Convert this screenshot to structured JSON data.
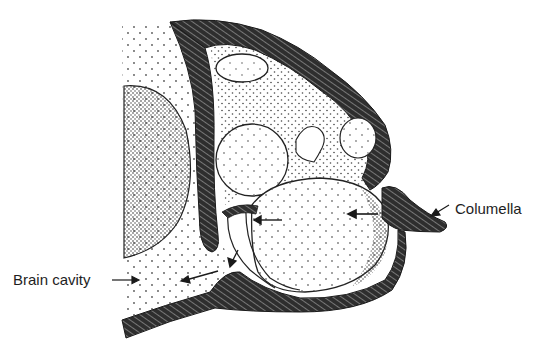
{
  "figure": {
    "type": "anatomical cross-section illustration",
    "colors": {
      "background": "#ffffff",
      "ink": "#1e1e1e",
      "bone_fill": "#3a3a3a",
      "stipple": "#555555"
    }
  },
  "labels": {
    "brain_cavity": "Brain cavity",
    "columella": "Columella"
  }
}
